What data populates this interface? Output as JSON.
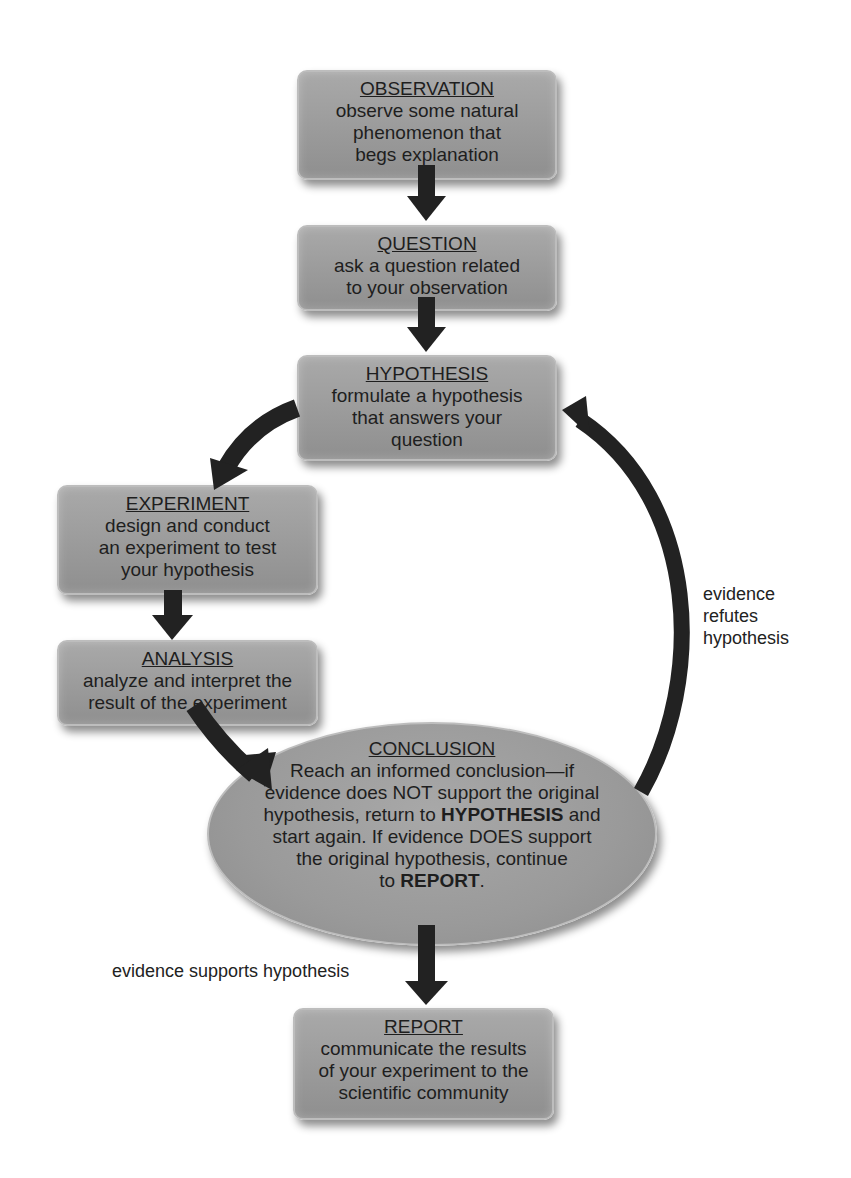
{
  "diagram": {
    "type": "flowchart",
    "colors": {
      "box_fill": "#9c9c9c",
      "box_border": "#bdbdbd",
      "arrow": "#222222",
      "text": "#1e1e1e",
      "background": "#ffffff"
    },
    "nodes": {
      "observation": {
        "title": "OBSERVATION",
        "desc": "observe some natural\nphenomenon that\nbegs explanation"
      },
      "question": {
        "title": "QUESTION",
        "desc": "ask a question related\nto your observation"
      },
      "hypothesis": {
        "title": "HYPOTHESIS",
        "desc": "formulate a hypothesis\nthat answers your\nquestion"
      },
      "experiment": {
        "title": "EXPERIMENT",
        "desc": "design and conduct\nan experiment to test\nyour hypothesis"
      },
      "analysis": {
        "title": "ANALYSIS",
        "desc": "analyze and interpret the\nresult of the experiment"
      },
      "conclusion": {
        "title": "CONCLUSION",
        "line1": "Reach an informed conclusion—if",
        "line2": "evidence does NOT support the original",
        "line3_pre": "hypothesis, return to ",
        "line3_bold": "HYPOTHESIS",
        "line3_post": " and",
        "line4": "start again. If evidence DOES support",
        "line5": "the original hypothesis, continue",
        "line6_pre": "to ",
        "line6_bold": "REPORT",
        "line6_post": "."
      },
      "report": {
        "title": "REPORT",
        "desc": "communicate the results\nof your experiment to the\nscientific community"
      }
    },
    "edge_labels": {
      "refutes": "evidence\nrefutes\nhypothesis",
      "supports": "evidence supports hypothesis"
    },
    "edges": [
      {
        "from": "OBSERVATION",
        "to": "QUESTION"
      },
      {
        "from": "QUESTION",
        "to": "HYPOTHESIS"
      },
      {
        "from": "HYPOTHESIS",
        "to": "EXPERIMENT"
      },
      {
        "from": "EXPERIMENT",
        "to": "ANALYSIS"
      },
      {
        "from": "ANALYSIS",
        "to": "CONCLUSION"
      },
      {
        "from": "CONCLUSION",
        "to": "HYPOTHESIS",
        "label": "evidence refutes hypothesis"
      },
      {
        "from": "CONCLUSION",
        "to": "REPORT",
        "label": "evidence supports hypothesis"
      }
    ]
  }
}
